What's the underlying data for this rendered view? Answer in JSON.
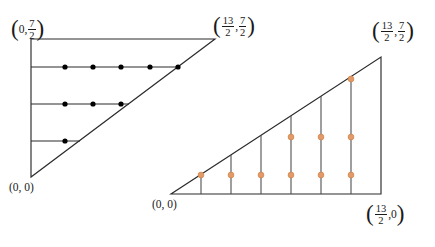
{
  "figure": {
    "kind": "two-triangle-riemann-sum-diagram",
    "colors": {
      "stroke": "#2b2b2b",
      "left_dot": "#000000",
      "right_dot": "#e09a6b",
      "right_dot_edge": "#d4813f",
      "background": "#ffffff"
    },
    "left_triangle": {
      "name": "horizontal-strips-triangle",
      "vertices": {
        "origin": {
          "x": 0,
          "y": 0
        },
        "top_left": {
          "x": 0,
          "y": 3.5
        },
        "top_right": {
          "x": 6.5,
          "y": 3.5
        }
      },
      "labels": {
        "origin": "(0, 0)",
        "top_left": {
          "paren_open": "(",
          "x": "0",
          "comma": ",",
          "y_num": "7",
          "y_den": "2",
          "paren_close": ")"
        },
        "top_right": {
          "paren_open": "(",
          "x_num": "13",
          "x_den": "2",
          "comma": ",",
          "y_num": "7",
          "y_den": "2",
          "paren_close": ")"
        }
      },
      "strips": [
        {
          "index": 1,
          "y": 2.8,
          "dots": 5
        },
        {
          "index": 2,
          "y": 2.1,
          "dots": 3
        },
        {
          "index": 3,
          "y": 1.4,
          "dots": 1
        }
      ],
      "total_dots": 9
    },
    "right_triangle": {
      "name": "vertical-strips-triangle",
      "vertices": {
        "origin": {
          "x": 0,
          "y": 0
        },
        "bottom_right": {
          "x": 6.5,
          "y": 0
        },
        "top_right": {
          "x": 6.5,
          "y": 3.5
        }
      },
      "labels": {
        "origin": "(0, 0)",
        "bottom_right": {
          "paren_open": "(",
          "x_num": "13",
          "x_den": "2",
          "comma": ",",
          "y": "0",
          "paren_close": ")"
        },
        "top_right": {
          "paren_open": "(",
          "x_num": "13",
          "x_den": "2",
          "comma": ",",
          "y_num": "7",
          "y_den": "2",
          "paren_close": ")"
        }
      },
      "strips": [
        {
          "index": 1,
          "x": 0.93,
          "dots": 1
        },
        {
          "index": 2,
          "x": 1.86,
          "dots": 1
        },
        {
          "index": 3,
          "x": 2.79,
          "dots": 1
        },
        {
          "index": 4,
          "x": 3.71,
          "dots": 2
        },
        {
          "index": 5,
          "x": 4.64,
          "dots": 2
        },
        {
          "index": 6,
          "x": 5.57,
          "dots": 3
        }
      ],
      "total_dots": 10
    }
  }
}
